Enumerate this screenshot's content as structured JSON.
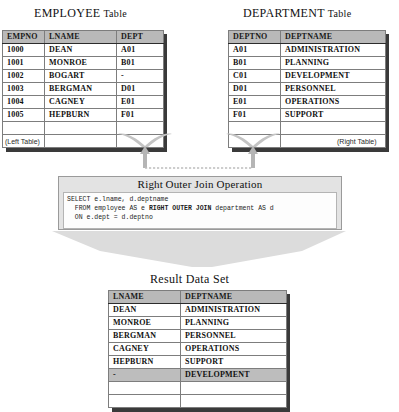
{
  "diagram": {
    "title_left": "EMPLOYEE Table",
    "title_right": "DEPARTMENT Table",
    "title_result": "Result Data Set",
    "label_left": "(Left Table)",
    "label_right": "(Right Table)",
    "operation_title": "Right Outer Join Operation"
  },
  "employee_table": {
    "title_word": "EMPLOYEE",
    "title_suffix": "Table",
    "columns": [
      "EMPNO",
      "LNAME",
      "DEPT"
    ],
    "rows": [
      [
        "1000",
        "DEAN",
        "A01"
      ],
      [
        "1001",
        "MONROE",
        "B01"
      ],
      [
        "1002",
        "BOGART",
        "-"
      ],
      [
        "1003",
        "BERGMAN",
        "D01"
      ],
      [
        "1004",
        "CAGNEY",
        "E01"
      ],
      [
        "1005",
        "HEPBURN",
        "F01"
      ]
    ]
  },
  "department_table": {
    "title_word": "DEPARTMENT",
    "title_suffix": "Table",
    "columns": [
      "DEPTNO",
      "DEPTNAME"
    ],
    "rows": [
      [
        "A01",
        "ADMINISTRATION"
      ],
      [
        "B01",
        "PLANNING"
      ],
      [
        "C01",
        "DEVELOPMENT"
      ],
      [
        "D01",
        "PERSONNEL"
      ],
      [
        "E01",
        "OPERATIONS"
      ],
      [
        "F01",
        "SUPPORT"
      ]
    ]
  },
  "sql": {
    "title_word1": "Right",
    "title_word2": "Outer",
    "title_word3": "Join",
    "title_word4": "Operation",
    "line1": "SELECT e.lname, d.deptname",
    "line2_pre": "  FROM employee AS e ",
    "line2_bold": "RIGHT OUTER JOIN",
    "line2_post": " department AS d",
    "line3": "  ON e.dept = d.deptno"
  },
  "result_table": {
    "title_word1": "Result",
    "title_word2": "Data",
    "title_word3": "Set",
    "columns": [
      "LNAME",
      "DEPTNAME"
    ],
    "rows": [
      {
        "cells": [
          "DEAN",
          "ADMINISTRATION"
        ],
        "shaded": false
      },
      {
        "cells": [
          "MONROE",
          "PLANNING"
        ],
        "shaded": false
      },
      {
        "cells": [
          "BERGMAN",
          "PERSONNEL"
        ],
        "shaded": false
      },
      {
        "cells": [
          "CAGNEY",
          "OPERATIONS"
        ],
        "shaded": false
      },
      {
        "cells": [
          "HEPBURN",
          "SUPPORT"
        ],
        "shaded": false
      },
      {
        "cells": [
          "-",
          "DEVELOPMENT"
        ],
        "shaded": true
      }
    ]
  },
  "colors": {
    "header_fill": "#b9b9b9",
    "shaded_row": "#bdbdbd",
    "panel_fill": "#e3e3e3",
    "arrow_fill": "#d8d8d8",
    "border": "#7d7d7d",
    "outer_border": "#2b2b2b"
  }
}
